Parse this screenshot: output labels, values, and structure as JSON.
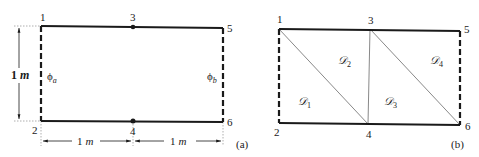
{
  "figure_a": {
    "caption": "(a)",
    "nodes": [
      {
        "id": "1",
        "x": 41,
        "y": 26
      },
      {
        "id": "2",
        "x": 41,
        "y": 121
      },
      {
        "id": "3",
        "x": 133,
        "y": 27
      },
      {
        "id": "4",
        "x": 133,
        "y": 121
      },
      {
        "id": "5",
        "x": 223,
        "y": 28
      },
      {
        "id": "6",
        "x": 223,
        "y": 122
      }
    ],
    "node_labels": {
      "n1": "1",
      "n2": "2",
      "n3": "3",
      "n4": "4",
      "n5": "5",
      "n6": "6"
    },
    "vertical_dimension": {
      "value": "1",
      "unit": "m"
    },
    "horizontal_dimension_left": {
      "value": "1",
      "unit": "m"
    },
    "horizontal_dimension_right": {
      "value": "1",
      "unit": "m"
    },
    "boundary_left": {
      "symbol": "ϕ",
      "subscript": "a"
    },
    "boundary_right": {
      "symbol": "ϕ",
      "subscript": "b"
    }
  },
  "figure_b": {
    "caption": "(b)",
    "node_labels": {
      "n1": "1",
      "n2": "2",
      "n3": "3",
      "n4": "4",
      "n5": "5",
      "n6": "6"
    },
    "domains": [
      {
        "symbol": "𝒟",
        "subscript": "1"
      },
      {
        "symbol": "𝒟",
        "subscript": "2"
      },
      {
        "symbol": "𝒟",
        "subscript": "3"
      },
      {
        "symbol": "𝒟",
        "subscript": "4"
      }
    ]
  },
  "colors": {
    "line": "#1a1a1a",
    "thin_line": "#555555",
    "guide": "#9a9a9a"
  }
}
